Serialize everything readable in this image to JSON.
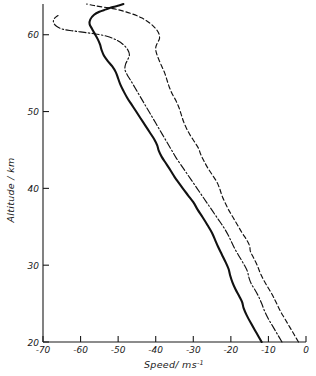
{
  "chart_data": {
    "type": "line",
    "title": "",
    "xlabel": "Speed / ms",
    "xlabel_exponent": "-1",
    "ylabel": "Altitude / km",
    "xlim": [
      -70,
      0
    ],
    "ylim": [
      20,
      64
    ],
    "grid": false,
    "legend": "none",
    "xticks": [
      -70,
      -60,
      -50,
      -40,
      -30,
      -20,
      -10,
      0
    ],
    "xtick_labels": [
      "-70",
      "-60",
      "-50",
      "-40",
      "-30",
      "-20",
      "-10",
      "0"
    ],
    "yticks": [
      20,
      30,
      40,
      50,
      60
    ],
    "ytick_labels": [
      "20",
      "30",
      "40",
      "50",
      "60"
    ],
    "series": [
      {
        "name": "solid-curve",
        "style": "solid",
        "color": "#111111",
        "points": [
          [
            -11.8,
            20.0
          ],
          [
            -13.2,
            21.2
          ],
          [
            -14.6,
            22.4
          ],
          [
            -15.8,
            23.5
          ],
          [
            -16.6,
            24.4
          ],
          [
            -17.0,
            25.2
          ],
          [
            -17.8,
            26.0
          ],
          [
            -18.8,
            26.9
          ],
          [
            -19.6,
            27.8
          ],
          [
            -20.2,
            28.7
          ],
          [
            -20.6,
            29.5
          ],
          [
            -21.4,
            30.4
          ],
          [
            -22.4,
            31.4
          ],
          [
            -23.4,
            32.4
          ],
          [
            -24.2,
            33.3
          ],
          [
            -25.0,
            34.2
          ],
          [
            -26.2,
            35.2
          ],
          [
            -27.6,
            36.3
          ],
          [
            -28.8,
            37.2
          ],
          [
            -30.0,
            38.2
          ],
          [
            -31.4,
            39.1
          ],
          [
            -32.8,
            40.0
          ],
          [
            -34.0,
            40.8
          ],
          [
            -35.0,
            41.5
          ],
          [
            -36.0,
            42.3
          ],
          [
            -37.2,
            43.2
          ],
          [
            -38.4,
            44.1
          ],
          [
            -39.2,
            44.9
          ],
          [
            -39.6,
            45.6
          ],
          [
            -40.4,
            46.4
          ],
          [
            -41.6,
            47.3
          ],
          [
            -42.8,
            48.2
          ],
          [
            -44.0,
            49.1
          ],
          [
            -45.2,
            50.0
          ],
          [
            -46.4,
            50.9
          ],
          [
            -47.6,
            51.8
          ],
          [
            -48.6,
            52.7
          ],
          [
            -49.4,
            53.5
          ],
          [
            -50.0,
            54.3
          ],
          [
            -50.6,
            55.1
          ],
          [
            -51.6,
            55.9
          ],
          [
            -52.8,
            56.6
          ],
          [
            -53.8,
            57.3
          ],
          [
            -54.4,
            58.0
          ],
          [
            -54.8,
            58.7
          ],
          [
            -55.4,
            59.4
          ],
          [
            -56.2,
            60.1
          ],
          [
            -57.0,
            60.8
          ],
          [
            -57.6,
            61.4
          ],
          [
            -57.4,
            62.0
          ],
          [
            -56.4,
            62.6
          ],
          [
            -55.0,
            63.0
          ],
          [
            -53.2,
            63.3
          ],
          [
            -51.4,
            63.6
          ],
          [
            -49.8,
            63.8
          ],
          [
            -48.6,
            64.0
          ]
        ]
      },
      {
        "name": "dash-dot-curve",
        "style": "dashdot",
        "color": "#111111",
        "points": [
          [
            -6.4,
            20.0
          ],
          [
            -7.6,
            21.0
          ],
          [
            -8.8,
            22.0
          ],
          [
            -10.0,
            23.0
          ],
          [
            -11.0,
            24.0
          ],
          [
            -11.8,
            25.0
          ],
          [
            -12.6,
            25.9
          ],
          [
            -13.6,
            26.8
          ],
          [
            -14.6,
            27.6
          ],
          [
            -15.2,
            28.4
          ],
          [
            -15.6,
            29.2
          ],
          [
            -16.4,
            30.0
          ],
          [
            -17.6,
            31.0
          ],
          [
            -18.8,
            32.0
          ],
          [
            -19.8,
            33.0
          ],
          [
            -20.8,
            34.0
          ],
          [
            -22.0,
            35.0
          ],
          [
            -23.4,
            36.0
          ],
          [
            -24.8,
            37.0
          ],
          [
            -26.2,
            38.0
          ],
          [
            -27.6,
            39.0
          ],
          [
            -29.0,
            40.0
          ],
          [
            -30.4,
            41.0
          ],
          [
            -31.8,
            42.0
          ],
          [
            -33.2,
            43.0
          ],
          [
            -34.6,
            44.0
          ],
          [
            -35.8,
            45.0
          ],
          [
            -37.0,
            46.0
          ],
          [
            -38.2,
            47.0
          ],
          [
            -39.4,
            48.0
          ],
          [
            -40.6,
            49.0
          ],
          [
            -41.8,
            50.0
          ],
          [
            -43.0,
            51.0
          ],
          [
            -44.2,
            52.0
          ],
          [
            -45.4,
            53.0
          ],
          [
            -46.6,
            54.0
          ],
          [
            -47.6,
            54.8
          ],
          [
            -48.2,
            55.5
          ],
          [
            -48.0,
            56.2
          ],
          [
            -47.4,
            56.8
          ],
          [
            -47.0,
            57.4
          ],
          [
            -47.4,
            58.0
          ],
          [
            -48.6,
            58.7
          ],
          [
            -50.4,
            59.3
          ],
          [
            -53.0,
            59.8
          ],
          [
            -56.0,
            60.1
          ],
          [
            -59.0,
            60.3
          ],
          [
            -62.0,
            60.5
          ],
          [
            -64.6,
            60.7
          ],
          [
            -66.4,
            61.1
          ],
          [
            -67.2,
            61.6
          ],
          [
            -67.0,
            62.1
          ],
          [
            -66.0,
            62.5
          ]
        ]
      },
      {
        "name": "dashed-curve",
        "style": "dashed",
        "color": "#111111",
        "points": [
          [
            -2.0,
            20.0
          ],
          [
            -3.2,
            21.0
          ],
          [
            -4.4,
            22.0
          ],
          [
            -5.6,
            23.0
          ],
          [
            -6.8,
            24.0
          ],
          [
            -7.8,
            25.0
          ],
          [
            -8.8,
            26.0
          ],
          [
            -10.0,
            27.0
          ],
          [
            -11.2,
            28.0
          ],
          [
            -12.2,
            29.0
          ],
          [
            -13.0,
            30.0
          ],
          [
            -14.0,
            31.0
          ],
          [
            -14.8,
            31.8
          ],
          [
            -15.0,
            32.5
          ],
          [
            -15.8,
            33.3
          ],
          [
            -17.0,
            34.2
          ],
          [
            -18.2,
            35.2
          ],
          [
            -19.4,
            36.2
          ],
          [
            -20.6,
            37.2
          ],
          [
            -21.6,
            38.2
          ],
          [
            -22.4,
            39.1
          ],
          [
            -23.0,
            40.0
          ],
          [
            -23.8,
            40.9
          ],
          [
            -25.0,
            41.8
          ],
          [
            -26.2,
            42.7
          ],
          [
            -27.2,
            43.6
          ],
          [
            -28.0,
            44.4
          ],
          [
            -28.6,
            45.2
          ],
          [
            -29.6,
            46.0
          ],
          [
            -30.8,
            46.9
          ],
          [
            -31.8,
            47.8
          ],
          [
            -32.6,
            48.7
          ],
          [
            -33.2,
            49.6
          ],
          [
            -33.8,
            50.5
          ],
          [
            -34.6,
            51.4
          ],
          [
            -35.6,
            52.3
          ],
          [
            -36.4,
            53.2
          ],
          [
            -37.0,
            54.1
          ],
          [
            -37.6,
            55.0
          ],
          [
            -38.4,
            55.9
          ],
          [
            -39.2,
            56.8
          ],
          [
            -39.8,
            57.6
          ],
          [
            -40.0,
            58.3
          ],
          [
            -39.6,
            58.9
          ],
          [
            -39.0,
            59.5
          ],
          [
            -39.2,
            60.2
          ],
          [
            -40.2,
            60.9
          ],
          [
            -41.8,
            61.6
          ],
          [
            -43.8,
            62.2
          ],
          [
            -46.2,
            62.7
          ],
          [
            -48.8,
            63.1
          ],
          [
            -51.4,
            63.4
          ],
          [
            -54.0,
            63.6
          ],
          [
            -56.4,
            63.8
          ],
          [
            -58.4,
            64.0
          ]
        ]
      }
    ]
  },
  "axes": {
    "x_title_text": "Speed/ ms",
    "x_title_sup": "-1",
    "y_title_text": "Altitude / km"
  }
}
